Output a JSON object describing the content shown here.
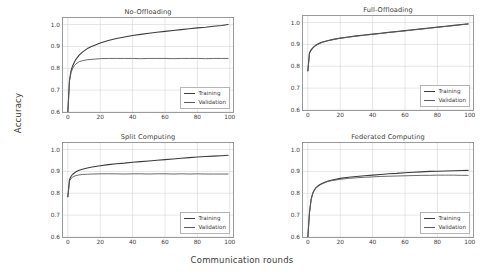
{
  "figure": {
    "xlabel": "Communication rounds",
    "ylabel": "Accuracy",
    "background": "#ffffff",
    "grid_color": "#cccccc",
    "axis_color": "#9a9a9a"
  },
  "series_style": {
    "training_color": "#3b3b3b",
    "validation_color": "#5a5a5a"
  },
  "legend": {
    "training_label": "Training",
    "validation_label": "Validation",
    "position": "lower right"
  },
  "chart_data": [
    {
      "type": "line",
      "title": "No-Offloading",
      "xlabel": "Communication rounds",
      "ylabel": "Accuracy",
      "xlim": [
        -3,
        102
      ],
      "ylim": [
        0.6,
        1.03
      ],
      "xticks": [
        0,
        20,
        40,
        60,
        80,
        100
      ],
      "yticks": [
        0.6,
        0.7,
        0.8,
        0.9,
        1.0
      ],
      "ytick_labels": [
        "0.6",
        "0.7",
        "0.8",
        "0.9",
        "1.0"
      ],
      "xtick_labels": [
        "0",
        "20",
        "40",
        "60",
        "80",
        "100"
      ],
      "grid": true,
      "legend": [
        "Training",
        "Validation"
      ],
      "series": [
        {
          "name": "Training",
          "x": [
            0,
            1,
            2,
            3,
            4,
            5,
            7,
            9,
            12,
            15,
            20,
            25,
            30,
            35,
            40,
            45,
            50,
            55,
            60,
            65,
            70,
            75,
            80,
            85,
            90,
            95,
            99
          ],
          "values": [
            0.6,
            0.745,
            0.79,
            0.812,
            0.828,
            0.841,
            0.86,
            0.874,
            0.89,
            0.901,
            0.916,
            0.927,
            0.936,
            0.943,
            0.95,
            0.955,
            0.96,
            0.965,
            0.969,
            0.973,
            0.977,
            0.981,
            0.985,
            0.988,
            0.992,
            0.996,
            1.0
          ]
        },
        {
          "name": "Validation",
          "x": [
            0,
            1,
            2,
            3,
            4,
            5,
            7,
            9,
            12,
            15,
            20,
            25,
            30,
            35,
            40,
            45,
            50,
            55,
            60,
            65,
            70,
            75,
            80,
            85,
            90,
            95,
            99
          ],
          "values": [
            0.6,
            0.742,
            0.782,
            0.8,
            0.812,
            0.82,
            0.83,
            0.835,
            0.839,
            0.841,
            0.844,
            0.845,
            0.845,
            0.845,
            0.845,
            0.844,
            0.845,
            0.845,
            0.845,
            0.844,
            0.845,
            0.845,
            0.845,
            0.844,
            0.845,
            0.845,
            0.845
          ]
        }
      ]
    },
    {
      "type": "line",
      "title": "Full-Offloading",
      "xlabel": "Communication rounds",
      "ylabel": "Accuracy",
      "xlim": [
        -3,
        102
      ],
      "ylim": [
        0.6,
        1.03
      ],
      "xticks": [
        0,
        20,
        40,
        60,
        80,
        100
      ],
      "yticks": [
        0.6,
        0.7,
        0.8,
        0.9,
        1.0
      ],
      "ytick_labels": [
        "0.6",
        "0.7",
        "0.8",
        "0.9",
        "1.0"
      ],
      "xtick_labels": [
        "0",
        "20",
        "40",
        "60",
        "80",
        "100"
      ],
      "grid": true,
      "legend": [
        "Training",
        "Validation"
      ],
      "series": [
        {
          "name": "Training",
          "x": [
            0,
            1,
            2,
            3,
            4,
            5,
            7,
            9,
            12,
            15,
            20,
            25,
            30,
            35,
            40,
            45,
            50,
            55,
            60,
            65,
            70,
            75,
            80,
            85,
            90,
            95,
            99
          ],
          "values": [
            0.78,
            0.862,
            0.875,
            0.884,
            0.891,
            0.897,
            0.905,
            0.911,
            0.917,
            0.922,
            0.929,
            0.934,
            0.939,
            0.943,
            0.947,
            0.951,
            0.955,
            0.959,
            0.963,
            0.967,
            0.971,
            0.975,
            0.979,
            0.983,
            0.987,
            0.991,
            0.994
          ]
        },
        {
          "name": "Validation",
          "x": [
            0,
            1,
            2,
            3,
            4,
            5,
            7,
            9,
            12,
            15,
            20,
            25,
            30,
            35,
            40,
            45,
            50,
            55,
            60,
            65,
            70,
            75,
            80,
            85,
            90,
            95,
            99
          ],
          "values": [
            0.778,
            0.858,
            0.872,
            0.882,
            0.889,
            0.895,
            0.903,
            0.909,
            0.916,
            0.921,
            0.928,
            0.933,
            0.938,
            0.942,
            0.946,
            0.95,
            0.955,
            0.958,
            0.962,
            0.966,
            0.97,
            0.974,
            0.978,
            0.982,
            0.986,
            0.99,
            0.993
          ]
        }
      ]
    },
    {
      "type": "line",
      "title": "Split Computing",
      "xlabel": "Communication rounds",
      "ylabel": "Accuracy",
      "xlim": [
        -3,
        102
      ],
      "ylim": [
        0.6,
        1.03
      ],
      "xticks": [
        0,
        20,
        40,
        60,
        80,
        100
      ],
      "yticks": [
        0.6,
        0.7,
        0.8,
        0.9,
        1.0
      ],
      "ytick_labels": [
        "0.6",
        "0.7",
        "0.8",
        "0.9",
        "1.0"
      ],
      "xtick_labels": [
        "0",
        "20",
        "40",
        "60",
        "80",
        "100"
      ],
      "grid": true,
      "legend": [
        "Training",
        "Validation"
      ],
      "series": [
        {
          "name": "Training",
          "x": [
            0,
            1,
            2,
            3,
            4,
            5,
            7,
            9,
            12,
            15,
            20,
            25,
            30,
            35,
            40,
            45,
            50,
            55,
            60,
            65,
            70,
            75,
            80,
            85,
            90,
            95,
            99
          ],
          "values": [
            0.785,
            0.862,
            0.878,
            0.887,
            0.893,
            0.898,
            0.905,
            0.91,
            0.916,
            0.92,
            0.926,
            0.931,
            0.935,
            0.938,
            0.942,
            0.945,
            0.948,
            0.951,
            0.954,
            0.957,
            0.96,
            0.963,
            0.966,
            0.968,
            0.97,
            0.972,
            0.974
          ]
        },
        {
          "name": "Validation",
          "x": [
            0,
            1,
            2,
            3,
            4,
            5,
            7,
            9,
            12,
            15,
            20,
            25,
            30,
            35,
            40,
            45,
            50,
            55,
            60,
            65,
            70,
            75,
            80,
            85,
            90,
            95,
            99
          ],
          "values": [
            0.783,
            0.856,
            0.868,
            0.874,
            0.878,
            0.881,
            0.884,
            0.886,
            0.887,
            0.888,
            0.889,
            0.889,
            0.889,
            0.888,
            0.889,
            0.889,
            0.888,
            0.889,
            0.889,
            0.888,
            0.889,
            0.888,
            0.889,
            0.888,
            0.888,
            0.888,
            0.888
          ]
        }
      ]
    },
    {
      "type": "line",
      "title": "Federated Computing",
      "xlabel": "Communication rounds",
      "ylabel": "Accuracy",
      "xlim": [
        -3,
        102
      ],
      "ylim": [
        0.6,
        1.03
      ],
      "xticks": [
        0,
        20,
        40,
        60,
        80,
        100
      ],
      "yticks": [
        0.6,
        0.7,
        0.8,
        0.9,
        1.0
      ],
      "ytick_labels": [
        "0.6",
        "0.7",
        "0.8",
        "0.9",
        "1.0"
      ],
      "xtick_labels": [
        "0",
        "20",
        "40",
        "60",
        "80",
        "100"
      ],
      "grid": true,
      "legend": [
        "Training",
        "Validation"
      ],
      "series": [
        {
          "name": "Training",
          "x": [
            0,
            1,
            2,
            3,
            4,
            5,
            7,
            9,
            12,
            15,
            20,
            25,
            30,
            35,
            40,
            45,
            50,
            55,
            60,
            65,
            70,
            75,
            80,
            85,
            90,
            95,
            99
          ],
          "values": [
            0.6,
            0.712,
            0.772,
            0.8,
            0.815,
            0.826,
            0.838,
            0.846,
            0.855,
            0.861,
            0.868,
            0.873,
            0.877,
            0.88,
            0.883,
            0.886,
            0.889,
            0.891,
            0.894,
            0.896,
            0.898,
            0.9,
            0.901,
            0.902,
            0.903,
            0.904,
            0.905
          ]
        },
        {
          "name": "Validation",
          "x": [
            0,
            1,
            2,
            3,
            4,
            5,
            7,
            9,
            12,
            15,
            20,
            25,
            30,
            35,
            40,
            45,
            50,
            55,
            60,
            65,
            70,
            75,
            80,
            85,
            90,
            95,
            99
          ],
          "values": [
            0.6,
            0.71,
            0.77,
            0.798,
            0.813,
            0.824,
            0.836,
            0.844,
            0.853,
            0.858,
            0.864,
            0.868,
            0.871,
            0.873,
            0.875,
            0.877,
            0.878,
            0.879,
            0.88,
            0.881,
            0.882,
            0.882,
            0.883,
            0.883,
            0.883,
            0.882,
            0.882
          ]
        }
      ]
    }
  ]
}
